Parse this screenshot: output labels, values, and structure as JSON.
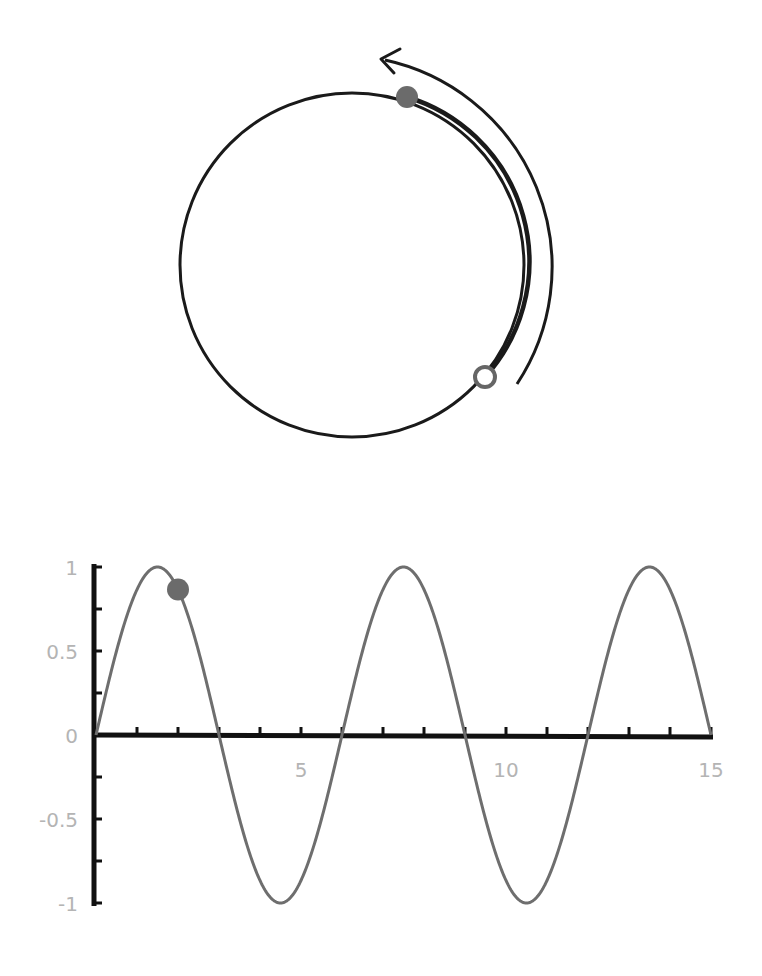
{
  "circle_diagram": {
    "center": [
      352,
      265
    ],
    "radius": 172,
    "stroke_color": "#1a1a1a",
    "start_point": {
      "type": "open-dot",
      "angle_deg": 40,
      "color": "#666666"
    },
    "current_point": {
      "type": "filled-dot",
      "angle_deg": -71,
      "color": "#6b6b6b"
    },
    "rotation_arrow": {
      "direction": "counterclockwise",
      "color": "#1a1a1a"
    }
  },
  "chart_data": {
    "type": "line",
    "title": "",
    "xlabel": "",
    "ylabel": "",
    "function": "y = sin(pi*x/3)",
    "period": 6,
    "xlim": [
      0,
      15
    ],
    "ylim": [
      -1,
      1
    ],
    "grid": false,
    "legend": null,
    "x_ticks": [
      0,
      1,
      2,
      3,
      4,
      5,
      6,
      7,
      8,
      9,
      10,
      11,
      12,
      13,
      14,
      15
    ],
    "x_tick_labels": [
      "5",
      "10",
      "15"
    ],
    "x_tick_label_positions": [
      5,
      10,
      15
    ],
    "y_ticks": [
      -1,
      -0.75,
      -0.5,
      -0.25,
      0,
      0.25,
      0.5,
      0.75,
      1
    ],
    "y_tick_labels": [
      "1",
      "0.5",
      "0",
      "-0.5",
      "-1"
    ],
    "y_tick_label_positions": [
      1,
      0.5,
      0,
      -0.5,
      -1
    ],
    "x": [
      0,
      0.5,
      1,
      1.5,
      2,
      2.5,
      3,
      3.5,
      4,
      4.5,
      5,
      5.5,
      6,
      6.5,
      7,
      7.5,
      8,
      8.5,
      9,
      9.5,
      10,
      10.5,
      11,
      11.5,
      12,
      12.5,
      13,
      13.5,
      14,
      14.5,
      15
    ],
    "series": [
      {
        "name": "sine",
        "color": "#6e6e6e",
        "values": [
          0,
          0.5,
          0.866,
          1,
          0.866,
          0.5,
          0,
          -0.5,
          -0.866,
          -1,
          -0.866,
          -0.5,
          0,
          0.5,
          0.866,
          1,
          0.866,
          0.5,
          0,
          -0.5,
          -0.866,
          -1,
          -0.866,
          -0.5,
          0,
          0.5,
          0.866,
          1,
          0.866,
          0.5,
          0
        ]
      }
    ],
    "marker": {
      "x": 2,
      "y": 0.866,
      "color": "#6b6b6b"
    },
    "axis_color": "#111111",
    "label_color": "#b4b4b4"
  }
}
